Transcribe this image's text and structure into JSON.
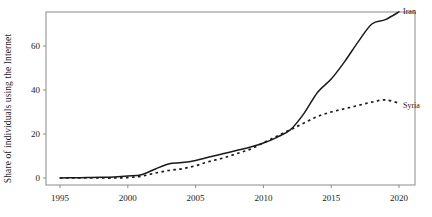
{
  "chart_data": {
    "type": "line",
    "title": "",
    "xlabel": "",
    "ylabel": "Share of individuals using the Internet",
    "xlim": [
      1994,
      2021
    ],
    "ylim": [
      -2,
      79
    ],
    "grid": false,
    "legend_position": "right-inline-labels",
    "xticks": [
      1995,
      2000,
      2005,
      2010,
      2015,
      2020
    ],
    "xtick_labels": [
      "1995",
      "2000",
      "2005",
      "2010",
      "2015",
      "2020"
    ],
    "yticks": [
      0,
      20,
      40,
      60
    ],
    "ytick_labels": [
      "0",
      "20",
      "40",
      "60"
    ],
    "x": [
      1995,
      1996,
      1997,
      1998,
      1999,
      2000,
      2001,
      2002,
      2003,
      2004,
      2005,
      2006,
      2007,
      2008,
      2009,
      2010,
      2011,
      2012,
      2013,
      2014,
      2015,
      2016,
      2017,
      2018,
      2019,
      2020
    ],
    "series": [
      {
        "name": "Iran",
        "style": "solid",
        "color": "#1a1a1a",
        "label": "Iran",
        "values": [
          0.0,
          0.1,
          0.2,
          0.3,
          0.5,
          0.9,
          1.5,
          4.0,
          6.4,
          7.0,
          8.0,
          9.5,
          11.0,
          12.5,
          14.0,
          15.9,
          18.5,
          22.0,
          29.4,
          39.0,
          45.0,
          53.0,
          62.0,
          70.0,
          72.0,
          75.5
        ]
      },
      {
        "name": "Syria",
        "style": "dotted",
        "color": "#1a1a1a",
        "label": "Syria",
        "values": [
          0.0,
          0.0,
          0.0,
          0.0,
          0.0,
          0.2,
          0.8,
          2.2,
          3.4,
          4.2,
          5.6,
          7.5,
          9.0,
          11.0,
          13.0,
          16.0,
          19.0,
          22.0,
          25.0,
          28.0,
          30.0,
          31.5,
          33.0,
          34.5,
          35.5,
          34.0
        ]
      }
    ]
  }
}
